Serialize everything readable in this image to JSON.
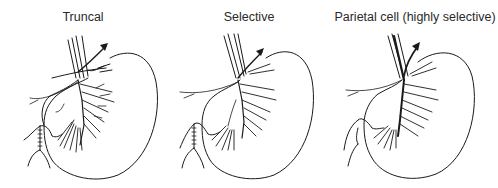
{
  "figure": {
    "panels": [
      {
        "title": "Truncal",
        "variant": "truncal"
      },
      {
        "title": "Selective",
        "variant": "selective"
      },
      {
        "title": "Parietal cell (highly selective)",
        "variant": "parietal-cell"
      }
    ],
    "colors": {
      "line": "#1a1a1a",
      "background": "#ffffff",
      "text": "#2a2a2a"
    }
  }
}
